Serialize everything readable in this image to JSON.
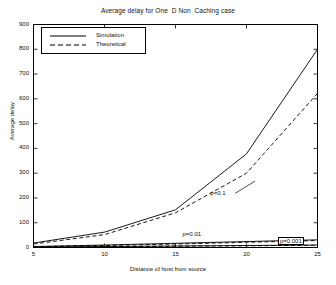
{
  "chart_data": {
    "type": "line",
    "title": "Average delay for One  D Non  Caching case",
    "xlabel": "Distance of host from source",
    "ylabel": "Average delay",
    "xlim": [
      5,
      25
    ],
    "ylim": [
      0,
      900
    ],
    "xticks": [
      5,
      10,
      15,
      20,
      25
    ],
    "yticks": [
      0,
      100,
      200,
      300,
      400,
      500,
      600,
      700,
      800,
      900
    ],
    "ytick_labels": [
      "0",
      "100",
      "200",
      "300",
      "400",
      "500",
      "600",
      "700",
      "800",
      "900"
    ],
    "xtick_labels": [
      "5",
      "10",
      "15",
      "20",
      "25"
    ],
    "grid": false,
    "legend": {
      "position": "upper-left",
      "entries": [
        {
          "label": "Simulation",
          "style": "solid"
        },
        {
          "label": "Theoretical",
          "style": "dashed"
        }
      ]
    },
    "x": [
      5,
      10,
      15,
      20,
      25
    ],
    "series": [
      {
        "name": "Simulation p=0.1",
        "style": "solid",
        "group": "p=0.1",
        "values": [
          18,
          62,
          152,
          378,
          800
        ]
      },
      {
        "name": "Theoretical p=0.1",
        "style": "dashed",
        "group": "p=0.1",
        "values": [
          14,
          52,
          140,
          300,
          622
        ]
      },
      {
        "name": "Simulation p=0.01",
        "style": "solid",
        "group": "p=0.01",
        "values": [
          4,
          10,
          17,
          24,
          31
        ]
      },
      {
        "name": "Theoretical p=0.01",
        "style": "dashed",
        "group": "p=0.01",
        "values": [
          3,
          8,
          14,
          21,
          28
        ]
      },
      {
        "name": "Simulation p=0.001",
        "style": "solid",
        "group": "p=0.001",
        "values": [
          2,
          4,
          6,
          8,
          10
        ]
      },
      {
        "name": "Theoretical p=0.001",
        "style": "dashed",
        "group": "p=0.001",
        "values": [
          1,
          3,
          5,
          7,
          9
        ]
      }
    ],
    "annotations": [
      {
        "text": "p=0.1",
        "x": 19.0,
        "y": 215,
        "boxed": false
      },
      {
        "text": "p=0.01",
        "x": 16.2,
        "y": 40,
        "boxed": false
      },
      {
        "text": "p=0.001",
        "x": 23.2,
        "y": 18,
        "boxed": true
      }
    ]
  }
}
